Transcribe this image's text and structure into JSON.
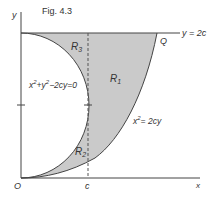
{
  "figure": {
    "title": "Fig. 4.3",
    "axes": {
      "x_label": "x",
      "y_label": "y",
      "origin_label": "O",
      "c_label": "c"
    },
    "line_label": "y = 2c",
    "point_label": "Q",
    "regions": {
      "r1": "R",
      "r1_sub": "1",
      "r2": "R",
      "r2_sub": "2",
      "r3": "R",
      "r3_sub": "3"
    },
    "circle_eq": {
      "a": "x",
      "b": "+y",
      "c": "−2cy=0",
      "sup": "2"
    },
    "parabola_eq": {
      "a": "x",
      "b": "= 2cy",
      "sup": "2"
    },
    "colors": {
      "shade": "#c9c9c9",
      "line": "#444444",
      "text": "#333333"
    }
  }
}
